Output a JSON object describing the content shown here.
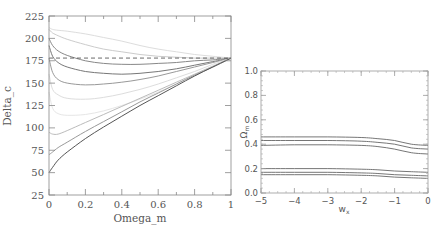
{
  "chart_data": [
    {
      "type": "line",
      "title": "",
      "xlabel": "Omega_m",
      "ylabel": "Delta_c",
      "xlim": [
        0,
        1
      ],
      "ylim": [
        25,
        225
      ],
      "xticks": [
        "0",
        "0.2",
        "0.4",
        "0.6",
        "0.8",
        "1"
      ],
      "yticks": [
        "25",
        "50",
        "75",
        "100",
        "125",
        "150",
        "175",
        "200",
        "225"
      ],
      "grid": false,
      "reference_line": {
        "style": "dashed",
        "y": 178
      },
      "x": [
        0.0,
        0.02,
        0.05,
        0.1,
        0.2,
        0.3,
        0.4,
        0.5,
        0.6,
        0.7,
        0.8,
        0.9,
        1.0
      ],
      "series": [
        {
          "name": "curve-1",
          "shade": "#dddddd",
          "values": [
            212,
            210,
            209,
            208,
            205,
            201,
            197,
            192,
            188,
            185,
            182,
            180,
            178
          ]
        },
        {
          "name": "curve-2",
          "shade": "#cccccc",
          "values": [
            210,
            206,
            203,
            199,
            193,
            188,
            185,
            182,
            180,
            179,
            178,
            178,
            178
          ]
        },
        {
          "name": "curve-3",
          "shade": "#888888",
          "values": [
            200,
            192,
            186,
            181,
            175,
            172,
            171,
            171,
            172,
            173,
            175,
            176,
            178
          ]
        },
        {
          "name": "curve-4",
          "shade": "#777777",
          "values": [
            192,
            180,
            173,
            168,
            163,
            161,
            160,
            161,
            163,
            166,
            170,
            174,
            178
          ]
        },
        {
          "name": "curve-5",
          "shade": "#999999",
          "values": [
            178,
            162,
            154,
            150,
            148,
            149,
            151,
            154,
            158,
            163,
            168,
            173,
            178
          ]
        },
        {
          "name": "curve-6",
          "shade": "#dddddd",
          "values": [
            160,
            143,
            137,
            133,
            132,
            134,
            138,
            143,
            149,
            156,
            163,
            171,
            178
          ]
        },
        {
          "name": "curve-7",
          "shade": "#e6e6e6",
          "values": [
            140,
            122,
            116,
            114,
            115,
            119,
            125,
            132,
            140,
            149,
            159,
            168,
            178
          ]
        },
        {
          "name": "curve-8",
          "shade": "#bbbbbb",
          "values": [
            95,
            93,
            93,
            97,
            106,
            115,
            124,
            133,
            142,
            151,
            160,
            169,
            178
          ]
        },
        {
          "name": "curve-9",
          "shade": "#999999",
          "values": [
            70,
            73,
            78,
            84,
            96,
            107,
            118,
            129,
            139,
            149,
            159,
            168,
            178
          ]
        },
        {
          "name": "curve-10",
          "shade": "#555555",
          "values": [
            50,
            56,
            64,
            73,
            88,
            101,
            113,
            125,
            136,
            147,
            158,
            168,
            178
          ]
        }
      ]
    },
    {
      "type": "line",
      "title": "",
      "xlabel": "w_x",
      "ylabel": "Ω_m",
      "xlim": [
        -5,
        0
      ],
      "ylim": [
        0.0,
        1.0
      ],
      "xticks": [
        "−5",
        "−4",
        "−3",
        "−2",
        "−1",
        "0"
      ],
      "yticks": [
        "0.0",
        "0.2",
        "0.4",
        "0.6",
        "0.8",
        "1.0"
      ],
      "grid": false,
      "x": [
        -5,
        -4,
        -3,
        -2,
        -1.5,
        -1,
        -0.5,
        0
      ],
      "series": [
        {
          "name": "upper-outer",
          "values": [
            0.46,
            0.46,
            0.46,
            0.455,
            0.445,
            0.43,
            0.4,
            0.39
          ]
        },
        {
          "name": "upper-mid",
          "values": [
            0.43,
            0.43,
            0.43,
            0.425,
            0.415,
            0.4,
            0.37,
            0.36
          ]
        },
        {
          "name": "upper-inner",
          "values": [
            0.39,
            0.395,
            0.395,
            0.39,
            0.38,
            0.36,
            0.33,
            0.32
          ]
        },
        {
          "name": "lower-outer",
          "values": [
            0.2,
            0.2,
            0.2,
            0.195,
            0.19,
            0.18,
            0.175,
            0.17
          ]
        },
        {
          "name": "lower-mid",
          "values": [
            0.17,
            0.17,
            0.17,
            0.165,
            0.16,
            0.15,
            0.145,
            0.14
          ]
        },
        {
          "name": "lower-inner",
          "values": [
            0.15,
            0.15,
            0.15,
            0.145,
            0.14,
            0.13,
            0.125,
            0.12
          ]
        }
      ]
    }
  ]
}
